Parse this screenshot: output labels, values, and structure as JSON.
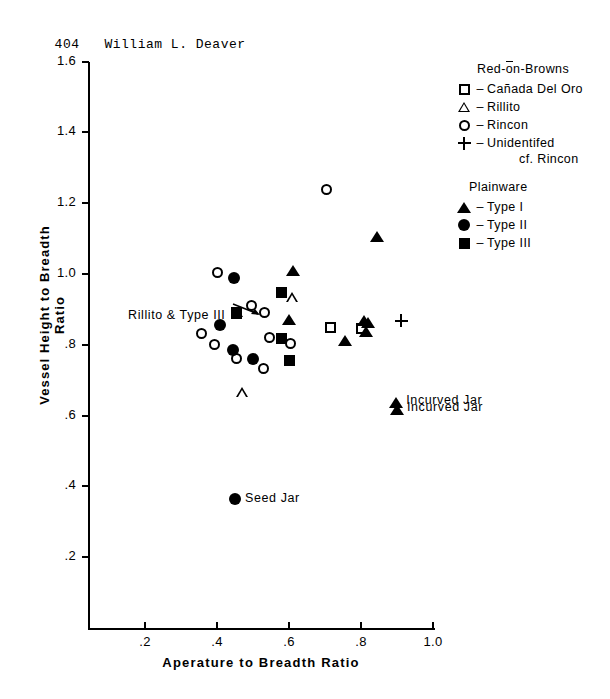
{
  "header": {
    "page_number": "404",
    "author": "William L. Deaver"
  },
  "chart_data": {
    "type": "scatter",
    "title": "",
    "xlabel": "Aperature to Breadth Ratio",
    "ylabel": "Vessel Height to Breadth Ratio",
    "xlim": [
      0.0,
      1.0
    ],
    "ylim": [
      0.0,
      1.6
    ],
    "xticks": [
      0.2,
      0.4,
      0.6,
      0.8,
      1.0
    ],
    "xtick_labels": [
      ".2",
      ".4",
      ".6",
      ".8",
      "1.0"
    ],
    "yticks": [
      0.2,
      0.4,
      0.6,
      0.8,
      1.0,
      1.2,
      1.4,
      1.6
    ],
    "ytick_labels": [
      ".2",
      ".4",
      ".6",
      ".8",
      "1.0",
      "1.2",
      "1.4",
      "1.6"
    ],
    "grid": false,
    "legend_position": "upper right",
    "series": [
      {
        "name": "Cañada Del Oro",
        "marker": "square-open",
        "group": "Red-on-Browns",
        "points": [
          {
            "x": 0.455,
            "y": 0.888
          },
          {
            "x": 0.715,
            "y": 0.848
          },
          {
            "x": 0.8,
            "y": 0.845
          }
        ]
      },
      {
        "name": "Rillito",
        "marker": "triangle-open",
        "group": "Red-on-Browns",
        "points": [
          {
            "x": 0.455,
            "y": 0.893
          },
          {
            "x": 0.608,
            "y": 0.962
          },
          {
            "x": 0.47,
            "y": 0.722
          }
        ]
      },
      {
        "name": "Rincon",
        "marker": "circle-open",
        "group": "Red-on-Browns",
        "points": [
          {
            "x": 0.4,
            "y": 1.005
          },
          {
            "x": 0.358,
            "y": 0.833
          },
          {
            "x": 0.705,
            "y": 1.24
          },
          {
            "x": 0.533,
            "y": 0.89
          },
          {
            "x": 0.496,
            "y": 0.91
          },
          {
            "x": 0.392,
            "y": 0.8
          },
          {
            "x": 0.545,
            "y": 0.82
          },
          {
            "x": 0.605,
            "y": 0.805
          },
          {
            "x": 0.455,
            "y": 0.76
          },
          {
            "x": 0.53,
            "y": 0.733
          }
        ]
      },
      {
        "name": "Unidentifed cf. Rincon",
        "marker": "plus",
        "group": "Red-on-Browns",
        "points": [
          {
            "x": 0.912,
            "y": 0.868
          }
        ]
      },
      {
        "name": "Type I",
        "marker": "triangle-filled",
        "group": "Plainware",
        "points": [
          {
            "x": 0.61,
            "y": 1.01
          },
          {
            "x": 0.845,
            "y": 1.105
          },
          {
            "x": 0.6,
            "y": 0.872
          },
          {
            "x": 0.755,
            "y": 0.812
          },
          {
            "x": 0.808,
            "y": 0.868
          },
          {
            "x": 0.82,
            "y": 0.862
          },
          {
            "x": 0.815,
            "y": 0.838
          },
          {
            "x": 0.898,
            "y": 0.638
          },
          {
            "x": 0.9,
            "y": 0.618
          }
        ]
      },
      {
        "name": "Type II",
        "marker": "circle-filled",
        "group": "Plainware",
        "points": [
          {
            "x": 0.448,
            "y": 0.99
          },
          {
            "x": 0.408,
            "y": 0.855
          },
          {
            "x": 0.445,
            "y": 0.785
          },
          {
            "x": 0.5,
            "y": 0.76
          },
          {
            "x": 0.45,
            "y": 0.365
          }
        ]
      },
      {
        "name": "Type III",
        "marker": "square-filled",
        "group": "Plainware",
        "points": [
          {
            "x": 0.455,
            "y": 0.89
          },
          {
            "x": 0.58,
            "y": 0.948
          },
          {
            "x": 0.578,
            "y": 0.818
          },
          {
            "x": 0.6,
            "y": 0.757
          }
        ]
      }
    ],
    "annotations": [
      {
        "text": "Rillito & Type III",
        "x": 0.455,
        "y": 0.893,
        "placement": "left-arrow"
      },
      {
        "text": "Seed Jar",
        "x": 0.45,
        "y": 0.365,
        "placement": "right"
      },
      {
        "text": "Incurved Jar",
        "x": 0.898,
        "y": 0.638,
        "placement": "right"
      },
      {
        "text": "Incurved Jar",
        "x": 0.9,
        "y": 0.618,
        "placement": "right"
      }
    ]
  },
  "legend": {
    "groups": [
      {
        "title": "Red-on-Browns",
        "dash": "–",
        "entries": [
          {
            "marker": "square-open",
            "label": "Cañada Del Oro",
            "sub": ""
          },
          {
            "marker": "triangle-open",
            "label": "Rillito",
            "sub": ""
          },
          {
            "marker": "circle-open",
            "label": "Rincon",
            "sub": ""
          },
          {
            "marker": "plus",
            "label": "Unidentifed",
            "sub": "cf. Rincon"
          }
        ]
      },
      {
        "title": "Plainware",
        "dash": "–",
        "entries": [
          {
            "marker": "triangle-filled",
            "label": "Type I",
            "sub": ""
          },
          {
            "marker": "circle-filled",
            "label": "Type II",
            "sub": ""
          },
          {
            "marker": "square-filled",
            "label": "Type III",
            "sub": ""
          }
        ]
      }
    ]
  },
  "colors": {
    "ink": "#000000",
    "paper": "#ffffff"
  }
}
